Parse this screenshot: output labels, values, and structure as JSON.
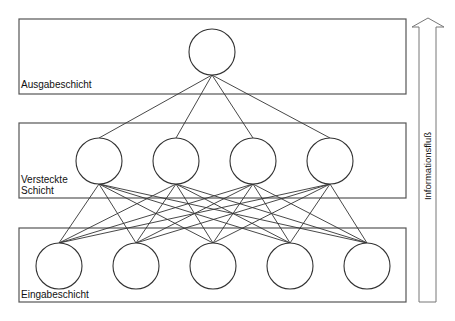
{
  "diagram": {
    "type": "neural-network",
    "layers": {
      "output": {
        "label": "Ausgabeschicht",
        "neuron_count": 1,
        "box": {
          "x": 19,
          "y": 19,
          "w": 387,
          "h": 75
        },
        "neurons_x": [
          212
        ],
        "neurons_y": 52
      },
      "hidden": {
        "label_line1": "Versteckte",
        "label_line2": "Schicht",
        "neuron_count": 4,
        "box": {
          "x": 19,
          "y": 123,
          "w": 387,
          "h": 75
        },
        "neurons_x": [
          99,
          176,
          253,
          330
        ],
        "neurons_y": 161
      },
      "input": {
        "label": "Eingabeschicht",
        "neuron_count": 5,
        "box": {
          "x": 19,
          "y": 228,
          "w": 387,
          "h": 74
        },
        "neurons_x": [
          59,
          136,
          213,
          290,
          367
        ],
        "neurons_y": 266
      }
    },
    "neuron_radius": 23,
    "flow_arrow": {
      "label": "Informationsfluß",
      "direction": "up"
    },
    "colors": {
      "box_stroke": "#555555",
      "neuron_stroke": "#333333",
      "edge": "#333333",
      "arrow_stroke": "#777777"
    }
  }
}
